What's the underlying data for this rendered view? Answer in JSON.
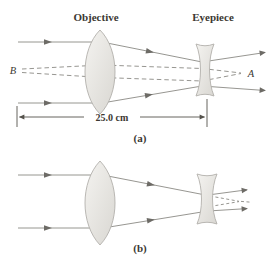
{
  "figure": {
    "labels": {
      "objective": "Objective",
      "eyepiece": "Eyepiece",
      "point_b": "B",
      "point_a": "A",
      "distance": "25.0 cm",
      "caption_a": "(a)",
      "caption_b": "(b)"
    },
    "colors": {
      "background": "#ffffff",
      "ray": "#8b8a84",
      "arrowhead": "#6d6b66",
      "dimension": "#55524c",
      "lens_fill_light": "#f4f3f0",
      "lens_fill_dark": "#d9d7d2",
      "lens_stroke": "#b2b0ab",
      "text": "#3c3933"
    }
  }
}
